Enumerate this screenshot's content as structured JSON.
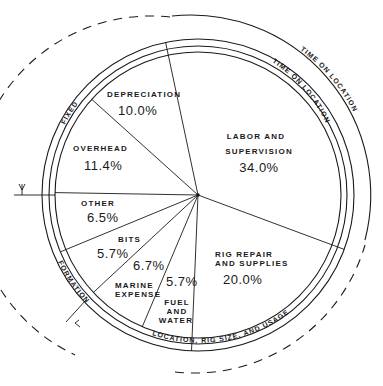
{
  "chart_data": {
    "type": "pie",
    "title": "",
    "slices": [
      {
        "name": "labor",
        "label_lines": [
          "LABOR AND",
          "SUPERVISION"
        ],
        "value": 34.0,
        "pct_text": "34.0%"
      },
      {
        "name": "rig-repair",
        "label_lines": [
          "RIG REPAIR",
          "AND SUPPLIES"
        ],
        "value": 20.0,
        "pct_text": "20.0%"
      },
      {
        "name": "fuel-water",
        "label_lines": [
          "FUEL",
          "AND",
          "WATER"
        ],
        "value": 5.7,
        "pct_text": "5.7%"
      },
      {
        "name": "marine-expense",
        "label_lines": [
          "MARINE",
          "EXPENSE"
        ],
        "value": 6.7,
        "pct_text": "6.7%"
      },
      {
        "name": "bits",
        "label_lines": [
          "BITS"
        ],
        "value": 5.7,
        "pct_text": "5.7%"
      },
      {
        "name": "other",
        "label_lines": [
          "OTHER"
        ],
        "value": 6.5,
        "pct_text": "6.5%"
      },
      {
        "name": "overhead",
        "label_lines": [
          "OVERHEAD"
        ],
        "value": 11.4,
        "pct_text": "11.4%"
      },
      {
        "name": "depreciation",
        "label_lines": [
          "DEPRECIATION"
        ],
        "value": 10.0,
        "pct_text": "10.0%"
      }
    ],
    "groupings": [
      {
        "name": "time-on-location-outer",
        "text": "TIME ON LOCATION",
        "style": "solid"
      },
      {
        "name": "time-on-location-inner",
        "text": "TIME ON LOCATION",
        "style": "solid"
      },
      {
        "name": "fixed",
        "text": "FIXED",
        "style": "solid"
      },
      {
        "name": "formation",
        "text": "FORMATION",
        "style": "solid"
      },
      {
        "name": "location-rig",
        "text": "LOCATION,  RIG SIZE, AND USAGE",
        "style": "solid"
      },
      {
        "name": "dashed-outer",
        "text": "",
        "style": "dashed"
      }
    ],
    "colors": {
      "ink": "#1a1a1a",
      "background": "#ffffff"
    }
  }
}
